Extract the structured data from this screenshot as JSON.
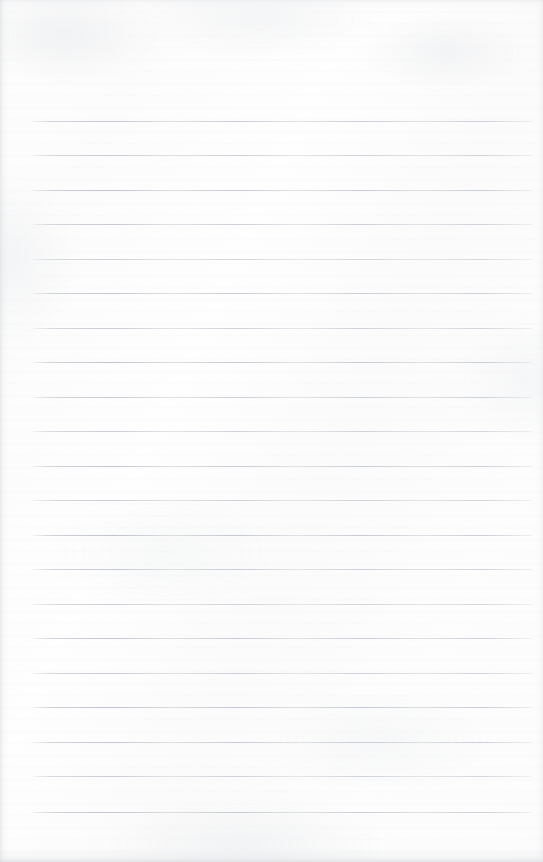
{
  "document": {
    "type": "scanned-lined-notebook-page",
    "title": "Blank Lined Notebook Page",
    "content_text": "",
    "has_handwriting": false,
    "has_printed_text": false,
    "page_width": 543,
    "page_height": 862,
    "paper_color": "#fdfdfd",
    "background_color": "#ffffff"
  },
  "ruling": {
    "line_color": "#bcc2cb",
    "line_count": 21,
    "line_thickness_px": 1,
    "first_line_y": 121,
    "line_spacing_px": 34.55,
    "left_margin_x": 33,
    "right_margin_x": 532,
    "line_length_px": 499,
    "top_blank_margin_px": 121,
    "bottom_blank_margin_px": 50,
    "lines": [
      {
        "index": 1,
        "y": 121,
        "x_start": 33,
        "x_end": 532,
        "text": ""
      },
      {
        "index": 2,
        "y": 155,
        "x_start": 33,
        "x_end": 532,
        "text": ""
      },
      {
        "index": 3,
        "y": 190,
        "x_start": 33,
        "x_end": 532,
        "text": ""
      },
      {
        "index": 4,
        "y": 224,
        "x_start": 33,
        "x_end": 532,
        "text": ""
      },
      {
        "index": 5,
        "y": 259,
        "x_start": 33,
        "x_end": 532,
        "text": ""
      },
      {
        "index": 6,
        "y": 293,
        "x_start": 33,
        "x_end": 532,
        "text": ""
      },
      {
        "index": 7,
        "y": 328,
        "x_start": 33,
        "x_end": 532,
        "text": ""
      },
      {
        "index": 8,
        "y": 362,
        "x_start": 33,
        "x_end": 532,
        "text": ""
      },
      {
        "index": 9,
        "y": 397,
        "x_start": 33,
        "x_end": 532,
        "text": ""
      },
      {
        "index": 10,
        "y": 431,
        "x_start": 33,
        "x_end": 532,
        "text": ""
      },
      {
        "index": 11,
        "y": 466,
        "x_start": 33,
        "x_end": 532,
        "text": ""
      },
      {
        "index": 12,
        "y": 500,
        "x_start": 33,
        "x_end": 532,
        "text": ""
      },
      {
        "index": 13,
        "y": 535,
        "x_start": 33,
        "x_end": 532,
        "text": ""
      },
      {
        "index": 14,
        "y": 569,
        "x_start": 33,
        "x_end": 532,
        "text": ""
      },
      {
        "index": 15,
        "y": 604,
        "x_start": 33,
        "x_end": 532,
        "text": ""
      },
      {
        "index": 16,
        "y": 638,
        "x_start": 33,
        "x_end": 532,
        "text": ""
      },
      {
        "index": 17,
        "y": 673,
        "x_start": 33,
        "x_end": 532,
        "text": ""
      },
      {
        "index": 18,
        "y": 707,
        "x_start": 33,
        "x_end": 532,
        "text": ""
      },
      {
        "index": 19,
        "y": 742,
        "x_start": 33,
        "x_end": 532,
        "text": ""
      },
      {
        "index": 20,
        "y": 776,
        "x_start": 33,
        "x_end": 532,
        "text": ""
      },
      {
        "index": 21,
        "y": 812,
        "x_start": 33,
        "x_end": 532,
        "text": ""
      }
    ]
  }
}
